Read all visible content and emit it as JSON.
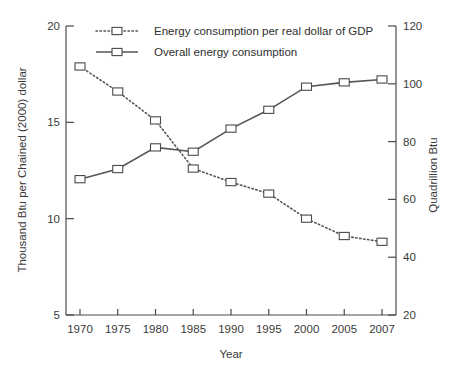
{
  "chart_data": {
    "type": "line",
    "title": "",
    "xlabel": "Year",
    "ylabel": "Thousand Btu per Chained (2000) dollar",
    "y2label": "Quadrillion Btu",
    "categories": [
      "1970",
      "1975",
      "1980",
      "1985",
      "1990",
      "1995",
      "2000",
      "2005",
      "2007"
    ],
    "xlim": [
      1970,
      2007
    ],
    "ylim": [
      5,
      20
    ],
    "y2lim": [
      20,
      120
    ],
    "yticks": [
      "5",
      "10",
      "15",
      "20"
    ],
    "ytick_values": [
      5,
      10,
      15,
      20
    ],
    "y2ticks": [
      "20",
      "40",
      "60",
      "80",
      "100",
      "120"
    ],
    "y2tick_values": [
      20,
      40,
      60,
      80,
      100,
      120
    ],
    "grid": false,
    "legend_position": "top-center",
    "series": [
      {
        "name": "Energy consumption per real dollar of GDP",
        "axis": "left",
        "style": "dotted",
        "marker": "square",
        "values": [
          17.9,
          16.6,
          15.1,
          12.6,
          11.9,
          11.3,
          10.0,
          9.1,
          8.8
        ]
      },
      {
        "name": "Overall energy consumption",
        "axis": "right",
        "style": "solid",
        "marker": "square",
        "values": [
          67.0,
          70.5,
          78.0,
          76.5,
          84.5,
          91.0,
          99.0,
          100.5,
          101.5
        ]
      }
    ]
  },
  "legend": {
    "items": [
      {
        "label": "Energy consumption per real dollar of GDP",
        "style": "dotted"
      },
      {
        "label": "Overall energy consumption",
        "style": "solid"
      }
    ]
  },
  "axes": {
    "x_title": "Year",
    "y_left_title": "Thousand Btu per Chained (2000) dollar",
    "y_right_title": "Quadrillion Btu"
  }
}
